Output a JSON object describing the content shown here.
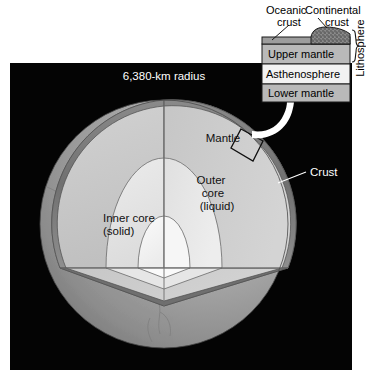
{
  "figure": {
    "background_color": "#ffffff",
    "panel_color": "#040404"
  },
  "earth": {
    "radius_label": "6,380-km radius",
    "layers": [
      {
        "name": "Crust",
        "label": "Crust",
        "color": "#8d8d8d"
      },
      {
        "name": "Mantle",
        "label": "Mantle",
        "color": "#c9c9c9"
      },
      {
        "name": "Outer core",
        "label": "Outer\ncore\n(liquid)",
        "line1": "Outer",
        "line2": "core",
        "line3": "(liquid)",
        "color": "#e4e4e4"
      },
      {
        "name": "Inner core",
        "label": "Inner core\n(solid)",
        "line1": "Inner core",
        "line2": "(solid)",
        "color": "#f4f4f4"
      }
    ],
    "surface_color": "#9a9a9a",
    "shadow_color": "#6e6e6e"
  },
  "inset": {
    "callout_arrow": "white-curved-arrow",
    "source_box": "mantle-detail-region",
    "top_labels": [
      {
        "line1": "Oceanic",
        "line2": "crust"
      },
      {
        "line1": "Continental",
        "line2": "crust"
      }
    ],
    "bracket_label": "Lithosphere",
    "bands": [
      {
        "label": "Upper mantle",
        "color": "#b9b9b9"
      },
      {
        "label": "Asthenosphere",
        "color": "#f2f2f2"
      },
      {
        "label": "Lower mantle",
        "color": "#b9b9b9"
      }
    ],
    "oceanic_crust_color": "#9d9d9d",
    "continental_crust_color": "#8a8a8a",
    "border_color": "#1a1a1a"
  }
}
